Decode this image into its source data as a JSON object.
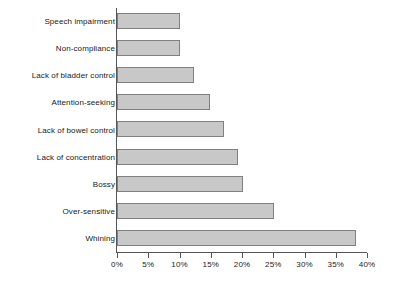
{
  "chart_data": {
    "type": "bar",
    "orientation": "horizontal",
    "title": "",
    "subtitle": "",
    "xlabel": "",
    "ylabel": "",
    "xlim": [
      0,
      40
    ],
    "xunit": "%",
    "grid": false,
    "legend": null,
    "axis_ticks": [
      "0%",
      "5%",
      "10%",
      "15%",
      "20%",
      "25%",
      "30%",
      "35%",
      "40%"
    ],
    "tick_values": [
      0,
      5,
      10,
      15,
      20,
      25,
      30,
      35,
      40
    ],
    "categories": [
      "Speech impairment",
      "Non-compliance",
      "Lack of bladder control",
      "Attention-seeking",
      "Lack of bowel control",
      "Lack of concentration",
      "Bossy",
      "Over-sensitive",
      "Whining"
    ],
    "values": [
      10.0,
      10.0,
      12.3,
      14.9,
      17.1,
      19.4,
      20.2,
      25.1,
      38.2
    ],
    "value_labels": [
      "10%",
      "10%",
      "12%",
      "15%",
      "17%",
      "19%",
      "20%",
      "25%",
      "38%"
    ],
    "colors": {
      "bar_fill": "#c8c8c8",
      "bar_border": "#808080",
      "axis": "#555555",
      "text": "#1a1a1a",
      "background": "#ffffff"
    }
  }
}
